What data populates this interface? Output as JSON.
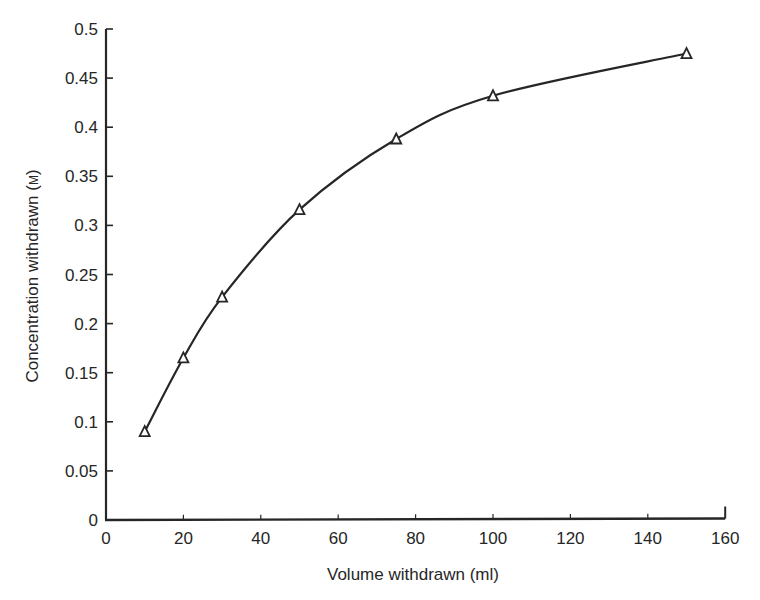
{
  "chart_data": {
    "type": "line",
    "title": "",
    "xlabel": "Volume withdrawn (ml)",
    "ylabel": "Concentration withdrawn (M)",
    "ylabel_parts": {
      "main": "Concentration withdrawn (",
      "unit": "M",
      "close": ")"
    },
    "xlim": [
      0,
      160
    ],
    "ylim": [
      0,
      0.5
    ],
    "x_ticks": [
      0,
      20,
      40,
      60,
      80,
      100,
      120,
      140,
      160
    ],
    "y_ticks": [
      0,
      0.05,
      0.1,
      0.15,
      0.2,
      0.25,
      0.3,
      0.35,
      0.4,
      0.45,
      0.5
    ],
    "y_tick_labels": [
      "0",
      "0.05",
      "0.1",
      "0.15",
      "0.2",
      "0.25",
      "0.3",
      "0.35",
      "0.4",
      "0.45",
      "0.5"
    ],
    "grid": false,
    "legend": null,
    "series": [
      {
        "name": "Concentration withdrawn",
        "marker": "open-triangle",
        "line": "smooth",
        "x": [
          10,
          20,
          30,
          50,
          75,
          100,
          150
        ],
        "y": [
          0.09,
          0.165,
          0.227,
          0.316,
          0.388,
          0.432,
          0.475
        ]
      }
    ]
  },
  "style": {
    "ink": "#262626",
    "background": "#ffffff"
  },
  "layout": {
    "x0_px": 106,
    "x_px_per_unit": 3.87,
    "y0_px": 520,
    "y_px_per_unit": 982
  }
}
